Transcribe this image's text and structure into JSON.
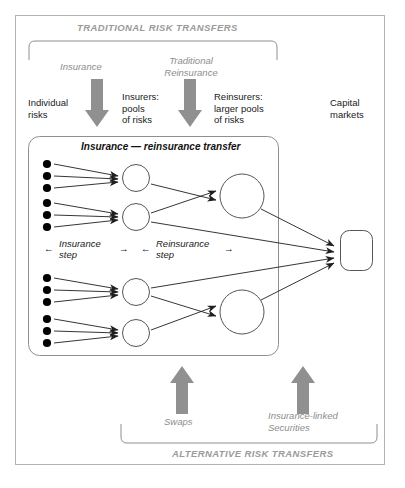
{
  "diagram": {
    "title_top_band": "TRADITIONAL RISK TRANSFERS",
    "title_bottom_band": "ALTERNATIVE RISK TRANSFERS",
    "inner_box_title": "Insurance — reinsurance transfer",
    "columns": [
      {
        "id": "individual-risks",
        "label": "Individual\nrisks"
      },
      {
        "id": "insurers",
        "label": "Insurers:\npools\nof risks"
      },
      {
        "id": "reinsurers",
        "label": "Reinsurers:\nlarger pools\nof risks"
      },
      {
        "id": "capital-markets",
        "label": "Capital\nmarkets"
      }
    ],
    "traditional_flows": [
      {
        "id": "insurance",
        "label": "Insurance"
      },
      {
        "id": "traditional-reinsurance",
        "label": "Traditional\nReinsurance"
      }
    ],
    "alternative_flows": [
      {
        "id": "swaps",
        "label": "Swaps"
      },
      {
        "id": "insurance-linked-securities",
        "label": "Insurance-linked\nSecurities"
      }
    ],
    "steps": [
      {
        "id": "insurance-step",
        "label": "Insurance\nstep"
      },
      {
        "id": "reinsurance-step",
        "label": "Reinsurance\nstep"
      }
    ],
    "arrow_glyph_left": "←",
    "arrow_glyph_right": "→",
    "network": {
      "risk_groups": 4,
      "risks_per_group": 3,
      "insurer_pools": 4,
      "reinsurer_pools": 2,
      "capital_market_nodes": 1
    },
    "colors": {
      "band_text": "#9a9a9a",
      "flow_arrow": "#8a8a8a",
      "flow_label": "#8d8d8d",
      "line": "#2b2b2b",
      "node_stroke": "#4a4a4a",
      "dot_fill": "#000000",
      "border": "#b0b0b0",
      "background": "#ffffff"
    }
  }
}
